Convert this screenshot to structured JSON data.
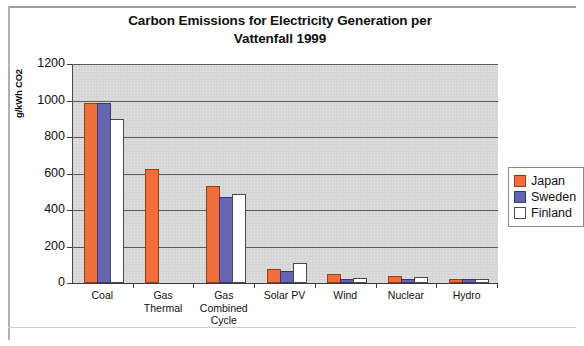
{
  "chart_data": {
    "type": "bar",
    "title": "Carbon Emissions for Electricity Generation per Vattenfall 1999",
    "title_line1": "Carbon Emissions for Electricity Generation per",
    "title_line2": "Vattenfall 1999",
    "xlabel": "",
    "ylabel": "g/kWh CO2",
    "ylim": [
      0,
      1200
    ],
    "ytick_step": 200,
    "yticks": [
      "1200",
      "1000",
      "800",
      "600",
      "400",
      "200",
      "0"
    ],
    "grid": "horizontal",
    "legend_position": "right",
    "plot_background": "#d6d6d6",
    "categories": [
      "Coal",
      "Gas Thermal",
      "Gas Combined Cycle",
      "Solar PV",
      "Wind",
      "Nuclear",
      "Hydro"
    ],
    "category_lines": [
      [
        "Coal"
      ],
      [
        "Gas",
        "Thermal"
      ],
      [
        "Gas",
        "Combined",
        "Cycle"
      ],
      [
        "Solar PV"
      ],
      [
        "Wind"
      ],
      [
        "Nuclear"
      ],
      [
        "Hydro"
      ]
    ],
    "series": [
      {
        "name": "Japan",
        "color": "#ef6f3c",
        "values": [
          975,
          615,
          519,
          66,
          37,
          25,
          11
        ]
      },
      {
        "name": "Sweden",
        "name_clipped": "Sweden",
        "color": "#6666b0",
        "values": [
          975,
          0,
          460,
          55,
          10,
          6,
          4
        ]
      },
      {
        "name": "Finland",
        "color": "#ffffff",
        "values": [
          890,
          0,
          475,
          100,
          14,
          22,
          4
        ]
      }
    ]
  },
  "legend": {
    "items": [
      {
        "label": "Japan",
        "swatch": "japan-swatch"
      },
      {
        "label": "Sweden",
        "swatch": "sweden-swatch"
      },
      {
        "label": "Finland",
        "swatch": "finland-swatch"
      }
    ]
  }
}
